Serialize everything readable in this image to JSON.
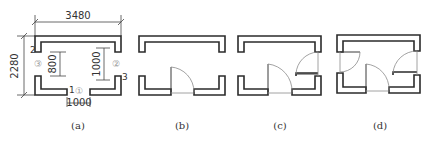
{
  "figure": {
    "panels": [
      {
        "id": "a",
        "caption": "(a)",
        "dimensions": {
          "width": "3480",
          "height": "2280",
          "left_opening": "800",
          "right_opening": "1000",
          "bottom_opening": "1000"
        },
        "opening_markers": {
          "left": "2",
          "bottom": "1",
          "right": "3"
        },
        "circled_labels": {
          "left": "③",
          "right": "②",
          "bottom": "①"
        }
      },
      {
        "id": "b",
        "caption": "(b)",
        "doors": [
          "bottom"
        ]
      },
      {
        "id": "c",
        "caption": "(c)",
        "doors": [
          "bottom",
          "right"
        ]
      },
      {
        "id": "d",
        "caption": "(d)",
        "doors": [
          "left",
          "bottom",
          "right"
        ]
      }
    ],
    "colors": {
      "wall": "#2b2b2b",
      "thin_line": "#8a8a8a",
      "text": "#333333",
      "circled": "#999999",
      "background": "#ffffff"
    }
  }
}
